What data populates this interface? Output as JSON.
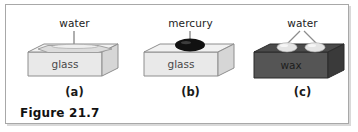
{
  "figure": {
    "caption": "Figure 21.7",
    "frame_border_color": "#a8a8a8",
    "background_color": "#ffffff"
  },
  "panels": [
    {
      "id": "a",
      "caption": "(a)",
      "callout_label": "water",
      "block_label": "glass",
      "block_material": "glass",
      "block_color": "#e8e8e8",
      "block_top_color": "#efefef",
      "block_side_color": "#d2d2d2",
      "block_edge_color": "#8e8e8e",
      "liquid": "water",
      "liquid_color": "#d8d8d8",
      "liquid_shape": "flat-spread-film",
      "wetting": "wets surface",
      "leader_lines": 1
    },
    {
      "id": "b",
      "caption": "(b)",
      "callout_label": "mercury",
      "block_label": "glass",
      "block_material": "glass",
      "block_color": "#e8e8e8",
      "block_top_color": "#efefef",
      "block_side_color": "#d2d2d2",
      "block_edge_color": "#8e8e8e",
      "liquid": "mercury",
      "liquid_color": "#111111",
      "liquid_shape": "single-bead",
      "wetting": "does not wet surface",
      "leader_lines": 1
    },
    {
      "id": "c",
      "caption": "(c)",
      "callout_label": "water",
      "block_label": "wax",
      "block_material": "wax",
      "block_color": "#555555",
      "block_top_color": "#4a4a4a",
      "block_side_color": "#3a3a3a",
      "block_edge_color": "#2b2b2b",
      "liquid": "water",
      "liquid_color": "#e2e2e2",
      "liquid_shape": "two-beads",
      "wetting": "does not wet surface",
      "leader_lines": 2
    }
  ]
}
